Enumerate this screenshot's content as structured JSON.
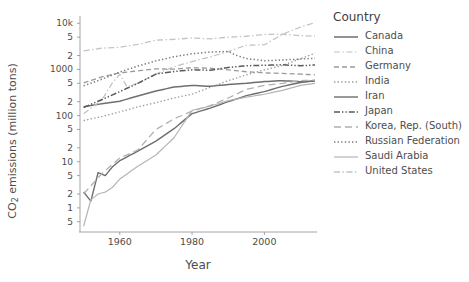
{
  "chart_data": {
    "type": "line",
    "title": "",
    "xlabel": "Year",
    "ylabel_html": "CO<sub>2</sub> emissions (million tons)",
    "ylabel": "CO2 emissions (million tons)",
    "legend_title": "Country",
    "legend_position": "right",
    "grid": false,
    "yscale": "log",
    "xlim": [
      1949,
      2014
    ],
    "ylim": [
      0.3,
      13000
    ],
    "xticks": [
      1960,
      1980,
      2000
    ],
    "xtick_labels": [
      "1960",
      "1980",
      "2000"
    ],
    "yticks": [
      10000,
      5000,
      2000,
      1000,
      500,
      200,
      100,
      50,
      20,
      10,
      5,
      2,
      1,
      0.5
    ],
    "ytick_labels": [
      "10k",
      "5",
      "2",
      "1000",
      "5",
      "2",
      "100",
      "5",
      "2",
      "10",
      "5",
      "2",
      "1",
      "5"
    ],
    "series": [
      {
        "name": "Canada",
        "color": "#6e6e6e",
        "dash": "solid",
        "width": 1.5,
        "x": [
          1950,
          1955,
          1960,
          1965,
          1970,
          1975,
          1980,
          1985,
          1990,
          1995,
          2000,
          2005,
          2010,
          2014
        ],
        "values": [
          155,
          180,
          205,
          265,
          340,
          415,
          450,
          430,
          470,
          500,
          545,
          570,
          540,
          560
        ]
      },
      {
        "name": "China",
        "color": "#c0c0c0",
        "dash": "dashdot",
        "width": 1.2,
        "x": [
          1950,
          1955,
          1958,
          1960,
          1962,
          1965,
          1970,
          1975,
          1980,
          1985,
          1990,
          1995,
          2000,
          2005,
          2010,
          2014
        ],
        "values": [
          110,
          215,
          520,
          780,
          420,
          500,
          790,
          1140,
          1480,
          1870,
          2430,
          3340,
          3420,
          5780,
          8290,
          10300
        ]
      },
      {
        "name": "Germany",
        "color": "#9a9a9a",
        "dash": "dashed",
        "width": 1.3,
        "x": [
          1950,
          1955,
          1960,
          1965,
          1970,
          1975,
          1980,
          1985,
          1990,
          1995,
          2000,
          2005,
          2010,
          2014
        ],
        "values": [
          510,
          690,
          840,
          930,
          1030,
          1010,
          1090,
          1060,
          980,
          890,
          840,
          820,
          790,
          760
        ]
      },
      {
        "name": "India",
        "color": "#9a9a9a",
        "dash": "dotted",
        "width": 1.3,
        "x": [
          1950,
          1955,
          1960,
          1965,
          1970,
          1975,
          1980,
          1985,
          1990,
          1995,
          2000,
          2005,
          2010,
          2014
        ],
        "values": [
          78,
          95,
          120,
          155,
          190,
          240,
          290,
          410,
          570,
          760,
          975,
          1220,
          1700,
          2240
        ]
      },
      {
        "name": "Iran",
        "color": "#6e6e6e",
        "dash": "solid",
        "width": 1.4,
        "x": [
          1950,
          1952,
          1954,
          1956,
          1958,
          1960,
          1965,
          1970,
          1975,
          1980,
          1985,
          1990,
          1995,
          2000,
          2005,
          2010,
          2014
        ],
        "values": [
          2.2,
          1.4,
          5.8,
          5.0,
          7.8,
          10.5,
          17,
          28,
          52,
          110,
          145,
          200,
          270,
          330,
          430,
          520,
          570
        ]
      },
      {
        "name": "Japan",
        "color": "#5a5a5a",
        "dash": "dashdotdot",
        "width": 1.5,
        "x": [
          1950,
          1955,
          1960,
          1965,
          1970,
          1975,
          1980,
          1985,
          1990,
          1995,
          2000,
          2005,
          2010,
          2014
        ],
        "values": [
          150,
          220,
          330,
          500,
          790,
          900,
          980,
          960,
          1100,
          1200,
          1230,
          1260,
          1200,
          1250
        ]
      },
      {
        "name": "Korea, Rep. (South)",
        "color": "#b0b0b0",
        "dash": "longdash",
        "width": 1.3,
        "x": [
          1950,
          1955,
          1960,
          1965,
          1970,
          1975,
          1980,
          1985,
          1990,
          1995,
          2000,
          2005,
          2010,
          2014
        ],
        "values": [
          2.0,
          5.5,
          12,
          18,
          50,
          85,
          125,
          165,
          240,
          370,
          450,
          500,
          570,
          590
        ]
      },
      {
        "name": "Russian Federation",
        "color": "#7d7d7d",
        "dash": "dotted",
        "width": 1.5,
        "x": [
          1950,
          1955,
          1960,
          1965,
          1970,
          1975,
          1980,
          1985,
          1990,
          1992,
          1995,
          2000,
          2005,
          2010,
          2014
        ],
        "values": [
          440,
          610,
          880,
          1180,
          1530,
          1880,
          2180,
          2380,
          2450,
          2050,
          1720,
          1540,
          1600,
          1680,
          1740
        ]
      },
      {
        "name": "Saudi Arabia",
        "color": "#b5b5b5",
        "dash": "solid",
        "width": 1.2,
        "x": [
          1950,
          1952,
          1954,
          1956,
          1958,
          1960,
          1965,
          1970,
          1975,
          1980,
          1985,
          1990,
          1995,
          2000,
          2005,
          2010,
          2014
        ],
        "values": [
          0.4,
          1.5,
          2.0,
          2.2,
          2.8,
          4.2,
          8.0,
          14,
          33,
          130,
          160,
          210,
          250,
          290,
          350,
          450,
          500
        ]
      },
      {
        "name": "United States",
        "color": "#c4c4c4",
        "dash": "dashdot",
        "width": 1.3,
        "x": [
          1950,
          1955,
          1960,
          1965,
          1970,
          1975,
          1980,
          1985,
          1990,
          1995,
          2000,
          2005,
          2010,
          2014
        ],
        "values": [
          2520,
          2880,
          3020,
          3480,
          4300,
          4480,
          4800,
          4600,
          4990,
          5230,
          5710,
          5790,
          5400,
          5250
        ]
      }
    ]
  },
  "axes": {
    "x_title": "Year",
    "y_title": "CO2 emissions (million tons)"
  },
  "legend": {
    "title": "Country",
    "items": [
      {
        "label": "Canada"
      },
      {
        "label": "China"
      },
      {
        "label": "Germany"
      },
      {
        "label": "India"
      },
      {
        "label": "Iran"
      },
      {
        "label": "Japan"
      },
      {
        "label": "Korea, Rep. (South)"
      },
      {
        "label": "Russian Federation"
      },
      {
        "label": "Saudi Arabia"
      },
      {
        "label": "United States"
      }
    ]
  }
}
